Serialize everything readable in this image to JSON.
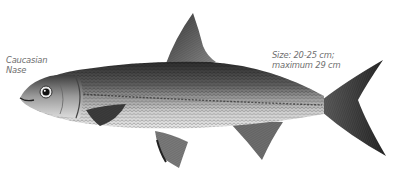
{
  "illustration": {
    "subject": "fish",
    "style": "monochrome engraving",
    "colors": {
      "background": "#ffffff",
      "dark_scales": "#2e2e2e",
      "mid_body": "#8a8a8a",
      "belly": "#d4d4d4",
      "fins": "#5a5a5a",
      "tail": "#2a2a2a",
      "label_text": "#6e6e6e"
    }
  },
  "labels": {
    "species": {
      "line1": "Caucasian",
      "line2": "Nase"
    },
    "size": {
      "line1": "Size: 20-25 cm;",
      "line2": "maximum 29 cm"
    }
  }
}
